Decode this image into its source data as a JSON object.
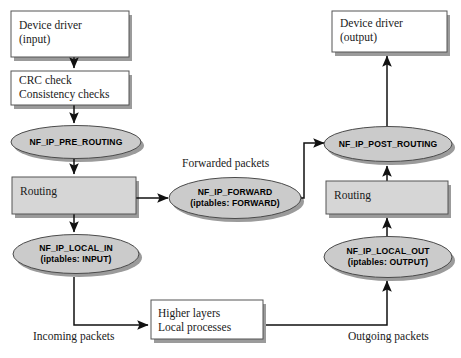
{
  "diagram": {
    "colors": {
      "box_fill": "#ffffff",
      "shaded_fill": "#d4d4d4",
      "ellipse_fill": "#c9c9c9",
      "stroke": "#4a4a4a",
      "shadow": "#9a9a9a",
      "arrow": "#111111",
      "text": "#1a1a1a"
    },
    "nodes": {
      "device_driver_input": {
        "label": "Device driver\n(input)",
        "shape": "box",
        "fill": "white"
      },
      "crc_check": {
        "label": "CRC check\nConsistency checks",
        "shape": "box",
        "fill": "white"
      },
      "pre_routing": {
        "label": "NF_IP_PRE_ROUTING",
        "shape": "ellipse",
        "fill": "shaded"
      },
      "routing_in": {
        "label": "Routing",
        "shape": "box",
        "fill": "shaded"
      },
      "local_in": {
        "label": "NF_IP_LOCAL_IN\n(iptables: INPUT)",
        "shape": "ellipse",
        "fill": "shaded"
      },
      "forward": {
        "label": "NF_IP_FORWARD\n(iptables: FORWARD)",
        "shape": "ellipse",
        "fill": "shaded"
      },
      "higher_layers": {
        "label": "Higher layers\nLocal processes",
        "shape": "box",
        "fill": "white"
      },
      "local_out": {
        "label": "NF_IP_LOCAL_OUT\n(iptables: OUTPUT)",
        "shape": "ellipse",
        "fill": "shaded"
      },
      "routing_out": {
        "label": "Routing",
        "shape": "box",
        "fill": "shaded"
      },
      "post_routing": {
        "label": "NF_IP_POST_ROUTING",
        "shape": "ellipse",
        "fill": "shaded"
      },
      "device_driver_output": {
        "label": "Device driver\n(output)",
        "shape": "box",
        "fill": "white"
      }
    },
    "captions": {
      "forwarded_packets": "Forwarded packets",
      "incoming_packets": "Incoming packets",
      "outgoing_packets": "Outgoing packets"
    }
  }
}
